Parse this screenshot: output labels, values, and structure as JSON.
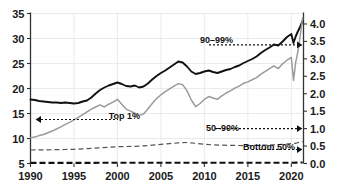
{
  "chart_data": {
    "type": "line",
    "title": "",
    "subtitle": "",
    "xlabel": "",
    "ylabel": "",
    "y2label": "",
    "xlim": [
      1990,
      2021.4
    ],
    "ylim": [
      5,
      35
    ],
    "y2lim": [
      0.0,
      4.3
    ],
    "grid": true,
    "legend_position": "inline-annotations",
    "xticks": [
      "1990",
      "1995",
      "2000",
      "2005",
      "2010",
      "2015",
      "2020"
    ],
    "xtick_values": [
      1990,
      1995,
      2000,
      2005,
      2010,
      2015,
      2020
    ],
    "yticks_left": [
      "5",
      "10",
      "15",
      "20",
      "25",
      "30",
      "35"
    ],
    "ytick_left_values": [
      5,
      10,
      15,
      20,
      25,
      30,
      35
    ],
    "yticks_right": [
      "0.0",
      "0.5",
      "1.0",
      "1.5",
      "2.0",
      "2.5",
      "3.0",
      "3.5",
      "4.0"
    ],
    "ytick_right_values": [
      0.0,
      0.5,
      1.0,
      1.5,
      2.0,
      2.5,
      3.0,
      3.5,
      4.0
    ],
    "annotations": [
      {
        "text": "90–99%",
        "axis": "right",
        "direction": "right",
        "value": 3.4
      },
      {
        "text": "Top 1%",
        "axis": "left",
        "direction": "left",
        "value": 13.8
      },
      {
        "text": "50–90%",
        "axis": "right",
        "direction": "right",
        "value": 1.0
      },
      {
        "text": "Bottom 50%",
        "axis": "right",
        "direction": "right",
        "value": 0.4
      }
    ],
    "series": [
      {
        "name": "Top 1%",
        "axis": "left",
        "style": "solid-black",
        "color": "#111111",
        "x": [
          1990.0,
          1990.5,
          1991.0,
          1991.5,
          1992.0,
          1992.5,
          1993.0,
          1993.5,
          1994.0,
          1994.5,
          1995.0,
          1995.5,
          1996.0,
          1996.5,
          1997.0,
          1997.5,
          1998.0,
          1998.5,
          1999.0,
          1999.5,
          2000.0,
          2000.5,
          2001.0,
          2001.5,
          2002.0,
          2002.5,
          2003.0,
          2003.5,
          2004.0,
          2004.5,
          2005.0,
          2005.5,
          2006.0,
          2006.5,
          2007.0,
          2007.5,
          2008.0,
          2008.5,
          2009.0,
          2009.5,
          2010.0,
          2010.5,
          2011.0,
          2011.5,
          2012.0,
          2012.5,
          2013.0,
          2013.5,
          2014.0,
          2014.5,
          2015.0,
          2015.5,
          2016.0,
          2016.5,
          2017.0,
          2017.5,
          2018.0,
          2018.5,
          2019.0,
          2019.5,
          2020.0,
          2020.25,
          2020.5,
          2020.75,
          2021.0,
          2021.3
        ],
        "y": [
          17.8,
          17.7,
          17.5,
          17.4,
          17.3,
          17.2,
          17.2,
          17.1,
          17.2,
          17.1,
          17.0,
          17.1,
          17.4,
          17.6,
          18.2,
          19.0,
          19.7,
          20.2,
          20.6,
          20.9,
          21.2,
          20.9,
          20.5,
          20.4,
          20.6,
          20.2,
          20.4,
          21.0,
          21.8,
          22.5,
          23.1,
          23.6,
          24.2,
          24.8,
          25.4,
          25.2,
          24.4,
          23.4,
          22.9,
          23.1,
          23.4,
          23.6,
          23.3,
          23.1,
          23.4,
          23.7,
          23.9,
          24.3,
          24.6,
          25.1,
          25.5,
          25.9,
          26.4,
          27.1,
          27.7,
          28.2,
          28.8,
          28.6,
          29.4,
          30.3,
          30.9,
          29.1,
          30.4,
          31.4,
          32.3,
          33.5
        ]
      },
      {
        "name": "90–99%",
        "axis": "right",
        "style": "solid-gray",
        "color": "#9a9a9a",
        "x": [
          1990.0,
          1990.5,
          1991.0,
          1991.5,
          1992.0,
          1992.5,
          1993.0,
          1993.5,
          1994.0,
          1994.5,
          1995.0,
          1995.5,
          1996.0,
          1996.5,
          1997.0,
          1997.5,
          1998.0,
          1998.5,
          1999.0,
          1999.5,
          2000.0,
          2000.5,
          2001.0,
          2001.5,
          2002.0,
          2002.5,
          2003.0,
          2003.5,
          2004.0,
          2004.5,
          2005.0,
          2005.5,
          2006.0,
          2006.5,
          2007.0,
          2007.5,
          2008.0,
          2008.5,
          2009.0,
          2009.5,
          2010.0,
          2010.5,
          2011.0,
          2011.5,
          2012.0,
          2012.5,
          2013.0,
          2013.5,
          2014.0,
          2014.5,
          2015.0,
          2015.5,
          2016.0,
          2016.5,
          2017.0,
          2017.5,
          2018.0,
          2018.5,
          2019.0,
          2019.5,
          2020.0,
          2020.25,
          2020.5,
          2020.75,
          2021.0,
          2021.3
        ],
        "y": [
          0.74,
          0.76,
          0.8,
          0.83,
          0.88,
          0.93,
          0.99,
          1.05,
          1.12,
          1.18,
          1.25,
          1.32,
          1.4,
          1.48,
          1.56,
          1.62,
          1.68,
          1.62,
          1.7,
          1.76,
          1.84,
          1.7,
          1.56,
          1.5,
          1.44,
          1.38,
          1.42,
          1.56,
          1.72,
          1.86,
          1.97,
          2.06,
          2.14,
          2.22,
          2.29,
          2.26,
          2.08,
          1.82,
          1.63,
          1.72,
          1.84,
          1.92,
          1.88,
          1.84,
          1.94,
          2.02,
          2.08,
          2.16,
          2.22,
          2.3,
          2.34,
          2.4,
          2.46,
          2.56,
          2.64,
          2.72,
          2.8,
          2.72,
          2.86,
          2.96,
          3.04,
          2.38,
          2.9,
          3.2,
          3.62,
          4.18
        ]
      },
      {
        "name": "50–90%",
        "axis": "left",
        "style": "dashed-gray",
        "color": "#555555",
        "x": [
          1990.0,
          1991.0,
          1992.0,
          1993.0,
          1994.0,
          1995.0,
          1996.0,
          1997.0,
          1998.0,
          1999.0,
          2000.0,
          2001.0,
          2002.0,
          2003.0,
          2004.0,
          2005.0,
          2006.0,
          2007.0,
          2008.0,
          2009.0,
          2010.0,
          2011.0,
          2012.0,
          2013.0,
          2014.0,
          2015.0,
          2016.0,
          2017.0,
          2018.0,
          2019.0,
          2020.0,
          2020.5,
          2021.0,
          2021.3
        ],
        "y": [
          7.7,
          7.72,
          7.74,
          7.76,
          7.8,
          7.84,
          7.92,
          8.02,
          8.14,
          8.26,
          8.36,
          8.4,
          8.42,
          8.52,
          8.66,
          8.82,
          8.98,
          9.12,
          9.2,
          9.04,
          8.86,
          8.72,
          8.66,
          8.62,
          8.6,
          8.58,
          8.62,
          8.68,
          8.74,
          8.84,
          8.96,
          9.04,
          9.3,
          9.46
        ]
      },
      {
        "name": "Bottom 50%",
        "axis": "left",
        "style": "dashed-black-thick",
        "color": "#111111",
        "x": [
          1990.0,
          1993.0,
          1996.0,
          1999.0,
          2002.0,
          2005.0,
          2008.0,
          2011.0,
          2014.0,
          2017.0,
          2020.0,
          2021.3
        ],
        "y": [
          5.12,
          5.12,
          5.13,
          5.14,
          5.14,
          5.15,
          5.16,
          5.14,
          5.14,
          5.15,
          5.16,
          5.2
        ]
      }
    ]
  },
  "colors": {
    "top1": "#111111",
    "p9099": "#9a9a9a",
    "p5090": "#555555",
    "bottom50": "#111111",
    "grid": "#e2e2e2",
    "axis": "#333333",
    "background": "#ffffff"
  }
}
